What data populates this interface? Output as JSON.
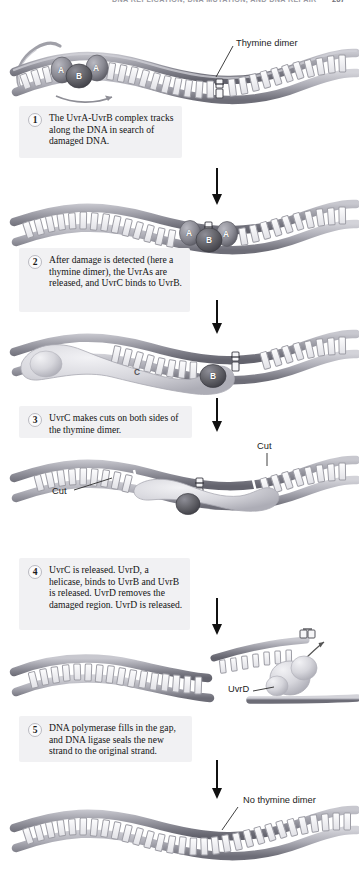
{
  "page": {
    "running_head": "DNA REPLICATION, DNA MUTATION, AND DNA REPAIR",
    "page_number": "267",
    "figure_topic": "Nucleotide excision repair of a thymine dimer in E. coli"
  },
  "steps": [
    {
      "number": "1",
      "text": "The UvrA-UvrB complex tracks along the DNA in search of damaged DNA."
    },
    {
      "number": "2",
      "text": "After damage is detected (here a thymine dimer), the UvrAs are released, and UvrC binds to UvrB."
    },
    {
      "number": "3",
      "text": "UvrC makes cuts on both sides of the thymine dimer."
    },
    {
      "number": "4",
      "text": "UvrC is released. UvrD, a helicase, binds to UvrB and UvrB is released. UvrD removes the damaged region. UvrD is released."
    },
    {
      "number": "5",
      "text": "DNA polymerase fills in the gap, and DNA ligase seals the new strand to the original strand."
    }
  ],
  "callouts": {
    "thymine_dimer": "Thymine dimer",
    "cut_left": "Cut",
    "cut_right": "Cut",
    "uvrd": "UvrD",
    "no_thymine_dimer": "No thymine dimer"
  },
  "protein_labels": {
    "panel1": [
      "A",
      "B",
      "A"
    ],
    "panel2": [
      "A",
      "B",
      "A"
    ],
    "panel3": [
      "C",
      "B"
    ]
  },
  "colors": {
    "callout_background": "#f1f1f3",
    "dna_backbone": "#8e8e96",
    "dna_backbone_dark": "#6a6a72",
    "protein_uvra": "#8c8c94",
    "protein_uvrb": "#5e5e66",
    "protein_uvrc": "#d8d8dc",
    "arrow": "#111111",
    "text": "#141414",
    "page_background": "#ffffff"
  }
}
